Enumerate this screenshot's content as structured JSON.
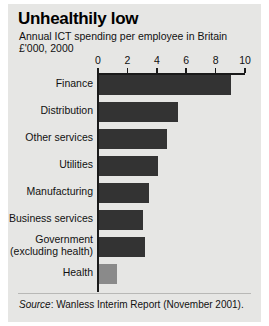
{
  "figure": {
    "title": "Unhealthily low",
    "subtitle": "Annual ICT spending per employee in Britain",
    "units": "£'000, 2000",
    "source_word": "Source",
    "source_text": ": Wanless Interim Report (November 2001)."
  },
  "chart_data": {
    "type": "bar",
    "orientation": "horizontal",
    "title": "Unhealthily low",
    "subtitle": "Annual ICT spending per employee in Britain",
    "xlabel": "£'000, 2000",
    "ylabel": "",
    "xlim": [
      0,
      10
    ],
    "xticks": [
      0,
      2,
      4,
      6,
      8,
      10
    ],
    "xticklabels": [
      "0",
      "2",
      "4",
      "6",
      "8",
      "10"
    ],
    "grid": false,
    "legend": false,
    "categories": [
      "Finance",
      "Distribution",
      "Other services",
      "Utilities",
      "Manufacturing",
      "Business services",
      "Government (excluding health)",
      "Health"
    ],
    "values": [
      9.0,
      5.4,
      4.6,
      4.0,
      3.4,
      3.0,
      3.1,
      1.2
    ],
    "bar_colors": [
      "#333333",
      "#333333",
      "#333333",
      "#333333",
      "#333333",
      "#333333",
      "#333333",
      "#8a8a8a"
    ],
    "bars": [
      {
        "label": "Finance",
        "label_lines": [
          "Finance"
        ],
        "value": 9.0,
        "color": "#333333"
      },
      {
        "label": "Distribution",
        "label_lines": [
          "Distribution"
        ],
        "value": 5.4,
        "color": "#333333"
      },
      {
        "label": "Other services",
        "label_lines": [
          "Other services"
        ],
        "value": 4.6,
        "color": "#333333"
      },
      {
        "label": "Utilities",
        "label_lines": [
          "Utilities"
        ],
        "value": 4.0,
        "color": "#333333"
      },
      {
        "label": "Manufacturing",
        "label_lines": [
          "Manufacturing"
        ],
        "value": 3.4,
        "color": "#333333"
      },
      {
        "label": "Business services",
        "label_lines": [
          "Business services"
        ],
        "value": 3.0,
        "color": "#333333"
      },
      {
        "label": "Government (excluding health)",
        "label_lines": [
          "Government",
          "(excluding health)"
        ],
        "value": 3.1,
        "color": "#333333"
      },
      {
        "label": "Health",
        "label_lines": [
          "Health"
        ],
        "value": 1.2,
        "color": "#8a8a8a"
      }
    ],
    "source": "Source: Wanless Interim Report (November 2001)."
  },
  "colors": {
    "panel_background": "#e6e6e4",
    "bar_dark": "#333333",
    "bar_light": "#8a8a8a",
    "axis": "#1a1a1a",
    "text": "#111111"
  }
}
